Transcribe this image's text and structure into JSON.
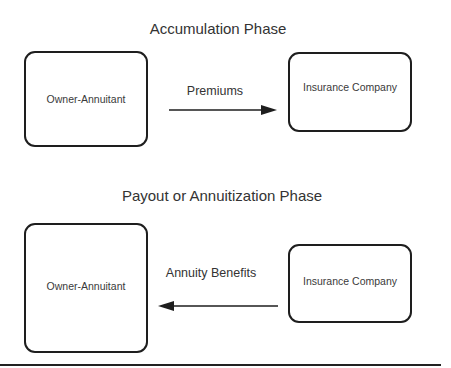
{
  "accumulation": {
    "title": "Accumulation Phase",
    "left_box": "Owner-Annuitant",
    "right_box": "Insurance Company",
    "arrow_label": "Premiums",
    "arrow_direction": "right"
  },
  "payout": {
    "title": "Payout or Annuitization Phase",
    "left_box": "Owner-Annuitant",
    "right_box": "Insurance Company",
    "arrow_label": "Annuity Benefits",
    "arrow_direction": "left"
  }
}
